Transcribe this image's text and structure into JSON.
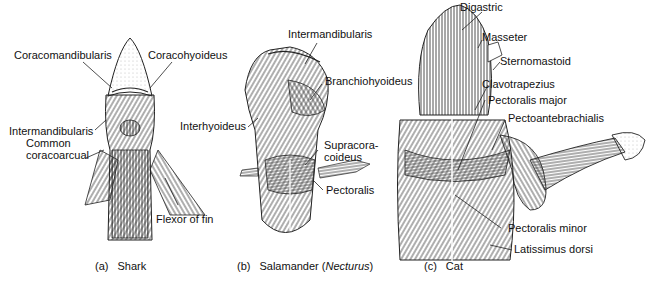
{
  "panels": [
    {
      "id": "a",
      "caption_tag": "(a)",
      "caption_name": "Shark",
      "labels": [
        {
          "text": "Coracomandibularis"
        },
        {
          "text": "Coracohyoideus"
        },
        {
          "text": "Intermandibularis"
        },
        {
          "text": "Common"
        },
        {
          "text": "coracoarcual"
        },
        {
          "text": "Flexor of fin"
        }
      ]
    },
    {
      "id": "b",
      "caption_tag": "(b)",
      "caption_name": "Salamander (",
      "caption_italic": "Necturus",
      "caption_end": ")",
      "labels": [
        {
          "text": "Intermandibularis"
        },
        {
          "text": "Branchiohyoideus"
        },
        {
          "text": "Interhyoideus"
        },
        {
          "text": "Supracora-"
        },
        {
          "text": "coideus"
        },
        {
          "text": "Pectoralis"
        }
      ]
    },
    {
      "id": "c",
      "caption_tag": "(c)",
      "caption_name": "Cat",
      "labels": [
        {
          "text": "Digastric"
        },
        {
          "text": "Masseter"
        },
        {
          "text": "Sternomastoid"
        },
        {
          "text": "Clavotrapezius"
        },
        {
          "text": "Pectoralis major"
        },
        {
          "text": "Pectoantebrachialis"
        },
        {
          "text": "Pectoralis minor"
        },
        {
          "text": "Latissimus dorsi"
        }
      ]
    }
  ]
}
